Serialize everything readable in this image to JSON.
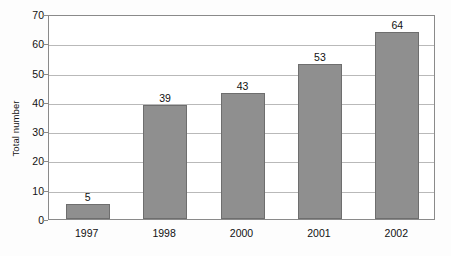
{
  "chart_data": {
    "type": "bar",
    "title": "",
    "xlabel": "",
    "ylabel": "Total number",
    "categories": [
      "1997",
      "1998",
      "2000",
      "2001",
      "2002"
    ],
    "values": [
      5,
      39,
      43,
      53,
      64
    ],
    "ylim": [
      0,
      70
    ],
    "yticks": [
      0,
      10,
      20,
      30,
      40,
      50,
      60,
      70
    ],
    "ytick_labels": [
      "0",
      "10",
      "20",
      "30",
      "40",
      "50",
      "60",
      "70"
    ],
    "value_labels": [
      "5",
      "39",
      "43",
      "53",
      "64"
    ],
    "grid": true,
    "grid_axis": "y",
    "legend": false,
    "legend_position": "none",
    "series": [
      {
        "name": "Total number",
        "values": [
          5,
          39,
          43,
          53,
          64
        ]
      }
    ],
    "colors": {
      "bar_fill": "#8f8f8f",
      "bar_edge": "#6e6e6e",
      "gridline": "#b9b9b9",
      "axis": "#8a8a8a",
      "text": "#111111",
      "plot_background": "#ffffff",
      "figure_background": "#fdfdfd"
    }
  }
}
